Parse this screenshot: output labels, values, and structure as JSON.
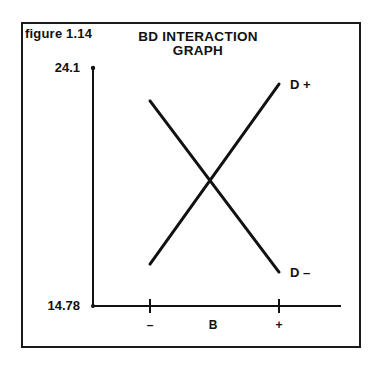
{
  "figure_label": "figure  1.14",
  "title_line1": "BD  INTERACTION",
  "title_line2": "GRAPH",
  "chart_data": {
    "type": "line",
    "title": "BD INTERACTION GRAPH",
    "xlabel": "B",
    "ylabel": "",
    "categories": [
      "–",
      "+"
    ],
    "ylim": [
      14.78,
      24.1
    ],
    "y_tick_labels": [
      "24.1",
      "14.78"
    ],
    "grid": false,
    "legend_position": "inline-right",
    "series": [
      {
        "name": "D +",
        "values": [
          16.42,
          23.47
        ]
      },
      {
        "name": "D –",
        "values": [
          22.81,
          16.11
        ]
      }
    ]
  },
  "axis": {
    "y_top": "24.1",
    "y_bottom": "14.78",
    "x_minus": "–",
    "x_label": "B",
    "x_plus": "+"
  },
  "legend": {
    "d_plus": "D +",
    "d_minus": "D –"
  }
}
